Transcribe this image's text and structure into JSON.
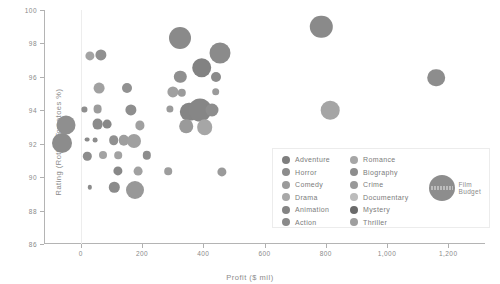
{
  "chart_data": {
    "type": "scatter",
    "title": "",
    "xlabel": "Profit ($ mil)",
    "ylabel": "Rating (Rotten Tomatoes %)",
    "xlim": [
      -120,
      1320
    ],
    "ylim": [
      86,
      100
    ],
    "xticks": [
      0,
      200,
      400,
      600,
      800,
      1000,
      1200
    ],
    "xtick_labels": [
      "0",
      "200",
      "400",
      "600",
      "800",
      "1,000",
      "1,200"
    ],
    "yticks": [
      86,
      88,
      90,
      92,
      94,
      96,
      98,
      100
    ],
    "ytick_labels": [
      "86",
      "88",
      "90",
      "92",
      "94",
      "96",
      "98",
      "100"
    ],
    "grid": false,
    "legend_position": "lower-right",
    "size_encodes": "Film Budget",
    "reference_line_x": 0,
    "points": [
      {
        "x": -60,
        "y": 92.05,
        "r": 10.0,
        "c": "#8c8c8c"
      },
      {
        "x": 30,
        "y": 97.25,
        "r": 4.6,
        "c": "#a3a3a3"
      },
      {
        "x": 65,
        "y": 97.3,
        "r": 5.6,
        "c": "#909090"
      },
      {
        "x": 325,
        "y": 98.3,
        "r": 11.0,
        "c": "#8a8a8a"
      },
      {
        "x": 785,
        "y": 99.0,
        "r": 11.2,
        "c": "#8a8a8a"
      },
      {
        "x": 395,
        "y": 96.55,
        "r": 9.8,
        "c": "#828282"
      },
      {
        "x": 455,
        "y": 97.45,
        "r": 10.5,
        "c": "#8b8b8b"
      },
      {
        "x": 325,
        "y": 96.0,
        "r": 6.2,
        "c": "#8f8f8f"
      },
      {
        "x": 440,
        "y": 96.0,
        "r": 5.0,
        "c": "#8b8b8b"
      },
      {
        "x": 1160,
        "y": 95.95,
        "r": 8.8,
        "c": "#8d8d8d"
      },
      {
        "x": 60,
        "y": 95.35,
        "r": 5.4,
        "c": "#a1a1a1"
      },
      {
        "x": 150,
        "y": 95.35,
        "r": 5.0,
        "c": "#919191"
      },
      {
        "x": 300,
        "y": 95.1,
        "r": 5.6,
        "c": "#a0a0a0"
      },
      {
        "x": 330,
        "y": 95.05,
        "r": 4.2,
        "c": "#9b9b9b"
      },
      {
        "x": 440,
        "y": 95.1,
        "r": 3.8,
        "c": "#9a9a9a"
      },
      {
        "x": 815,
        "y": 94.0,
        "r": 9.3,
        "c": "#a5a5a5"
      },
      {
        "x": 12,
        "y": 94.05,
        "r": 2.6,
        "c": "#8e8e8e"
      },
      {
        "x": 55,
        "y": 94.05,
        "r": 4.4,
        "c": "#9c9c9c"
      },
      {
        "x": 165,
        "y": 94.0,
        "r": 5.6,
        "c": "#8e8e8e"
      },
      {
        "x": 290,
        "y": 94.1,
        "r": 3.6,
        "c": "#9b9b9b"
      },
      {
        "x": 355,
        "y": 93.9,
        "r": 9.2,
        "c": "#858585"
      },
      {
        "x": 388,
        "y": 94.0,
        "r": 11.5,
        "c": "#868686"
      },
      {
        "x": 430,
        "y": 94.0,
        "r": 6.5,
        "c": "#8d8d8d"
      },
      {
        "x": -48,
        "y": 93.1,
        "r": 9.5,
        "c": "#8f8f8f"
      },
      {
        "x": 55,
        "y": 93.15,
        "r": 5.4,
        "c": "#8b8b8b"
      },
      {
        "x": 85,
        "y": 93.15,
        "r": 4.4,
        "c": "#888888"
      },
      {
        "x": 192,
        "y": 93.1,
        "r": 4.6,
        "c": "#a0a0a0"
      },
      {
        "x": 345,
        "y": 93.05,
        "r": 6.8,
        "c": "#9a9a9a"
      },
      {
        "x": 405,
        "y": 93.0,
        "r": 7.8,
        "c": "#a6a6a6"
      },
      {
        "x": 22,
        "y": 92.25,
        "r": 2.4,
        "c": "#8a8a8a"
      },
      {
        "x": 48,
        "y": 92.2,
        "r": 2.4,
        "c": "#8d8d8d"
      },
      {
        "x": 108,
        "y": 92.2,
        "r": 4.8,
        "c": "#909090"
      },
      {
        "x": 140,
        "y": 92.2,
        "r": 5.2,
        "c": "#9e9e9e"
      },
      {
        "x": 175,
        "y": 92.15,
        "r": 7.0,
        "c": "#a0a0a0"
      },
      {
        "x": 22,
        "y": 91.25,
        "r": 4.2,
        "c": "#8c8c8c"
      },
      {
        "x": 72,
        "y": 91.3,
        "r": 4.0,
        "c": "#a3a3a3"
      },
      {
        "x": 122,
        "y": 91.3,
        "r": 3.8,
        "c": "#a2a2a2"
      },
      {
        "x": 215,
        "y": 91.3,
        "r": 4.2,
        "c": "#8d8d8d"
      },
      {
        "x": 120,
        "y": 90.35,
        "r": 4.6,
        "c": "#888888"
      },
      {
        "x": 188,
        "y": 90.35,
        "r": 4.4,
        "c": "#a1a1a1"
      },
      {
        "x": 285,
        "y": 90.35,
        "r": 3.8,
        "c": "#9d9d9d"
      },
      {
        "x": 460,
        "y": 90.3,
        "r": 4.6,
        "c": "#9a9a9a"
      },
      {
        "x": 30,
        "y": 89.4,
        "r": 2.2,
        "c": "#8b8b8b"
      },
      {
        "x": 110,
        "y": 89.4,
        "r": 5.2,
        "c": "#8b8b8b"
      },
      {
        "x": 178,
        "y": 89.25,
        "r": 9.0,
        "c": "#989898"
      }
    ]
  },
  "legend": {
    "columns": [
      [
        {
          "label": "Adventure",
          "color": "#7e7e7e"
        },
        {
          "label": "Horror",
          "color": "#8c8c8c"
        },
        {
          "label": "Comedy",
          "color": "#9a9a9a"
        },
        {
          "label": "Drama",
          "color": "#a8a8a8"
        },
        {
          "label": "Animation",
          "color": "#848484"
        },
        {
          "label": "Action",
          "color": "#8a8a8a"
        }
      ],
      [
        {
          "label": "Romance",
          "color": "#a6a6a6"
        },
        {
          "label": "Biography",
          "color": "#8d8d8d"
        },
        {
          "label": "Crime",
          "color": "#999999"
        },
        {
          "label": "Documentary",
          "color": "#bcbcbc"
        },
        {
          "label": "Mystery",
          "color": "#6a6a6a"
        },
        {
          "label": "Thriller",
          "color": "#9e9e9e"
        }
      ]
    ],
    "size_key": {
      "line1": "Film",
      "line2": "Budget"
    }
  }
}
